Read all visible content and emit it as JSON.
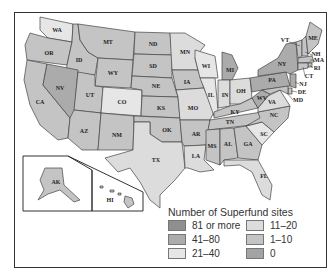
{
  "legend": {
    "title": "Number of Superfund sites",
    "items": [
      {
        "label": "81 or more",
        "color": "#8f8f8f"
      },
      {
        "label": "11–20",
        "color": "#dcdcdc"
      },
      {
        "label": "41–80",
        "color": "#ababab"
      },
      {
        "label": "1–10",
        "color": "#c4c4c4"
      },
      {
        "label": "21–40",
        "color": "#e6e6e6"
      },
      {
        "label": "0",
        "color": "#a3a3a3"
      }
    ]
  },
  "states": {
    "WA": "WA",
    "OR": "OR",
    "CA": "CA",
    "ID": "ID",
    "NV": "NV",
    "MT": "MT",
    "WY": "WY",
    "UT": "UT",
    "CO": "CO",
    "AZ": "AZ",
    "NM": "NM",
    "ND": "ND",
    "SD": "SD",
    "NE": "NE",
    "KS": "KS",
    "OK": "OK",
    "TX": "TX",
    "MN": "MN",
    "IA": "IA",
    "MO": "MO",
    "AR": "AR",
    "LA": "LA",
    "WI": "WI",
    "IL": "IL",
    "MI": "MI",
    "IN": "IN",
    "OH": "OH",
    "KY": "KY",
    "TN": "TN",
    "MS": "MS",
    "AL": "AL",
    "GA": "GA",
    "FL": "FL",
    "SC": "SC",
    "NC": "NC",
    "VA": "VA",
    "WV": "WV",
    "PA": "PA",
    "NY": "NY",
    "VT": "VT",
    "NH": "NH",
    "ME": "ME",
    "MA": "MA",
    "RI": "RI",
    "CT": "CT",
    "NJ": "NJ",
    "DE": "DE",
    "MD": "MD",
    "AK": "AK",
    "HI": "HI"
  }
}
